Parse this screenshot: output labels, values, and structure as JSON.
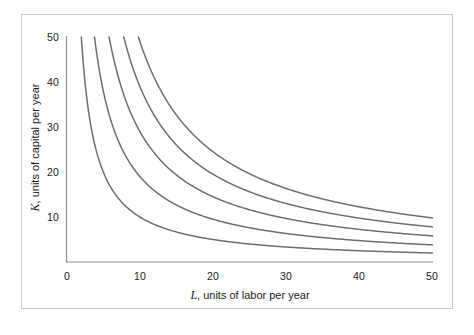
{
  "figure": {
    "background_color": "#ffffff",
    "frame_color": "#c9c9c9",
    "curve_color": "#6e6e6e"
  },
  "axes": {
    "x": {
      "var_symbol": "L",
      "label_rest": ", units of labor per year",
      "full_label": "L, units of labor per year",
      "ticks": [
        "0",
        "10",
        "20",
        "30",
        "40",
        "50"
      ],
      "tick_values": [
        0,
        10,
        20,
        30,
        40,
        50
      ],
      "min": 0,
      "max": 50
    },
    "y": {
      "var_symbol": "K",
      "label_rest": ", units of capital per year",
      "full_label": "K, units of capital per year",
      "ticks": [
        "10",
        "20",
        "30",
        "40",
        "50"
      ],
      "tick_values": [
        10,
        20,
        30,
        40,
        50
      ],
      "min": 0,
      "max": 50
    }
  },
  "chart_data": {
    "type": "line",
    "title": "",
    "subtitle": "",
    "xlabel": "L, units of labor per year",
    "ylabel": "K, units of capital per year",
    "xlim": [
      0,
      50
    ],
    "ylim": [
      0,
      50
    ],
    "xticks": [
      0,
      10,
      20,
      30,
      40,
      50
    ],
    "yticks": [
      0,
      10,
      20,
      30,
      40,
      50
    ],
    "grid": false,
    "legend": "none",
    "annotations": [],
    "curve_family": "isoquants, K = C / L (rectangular hyperbolas)",
    "series": [
      {
        "name": "isoquant-1",
        "constant": 100,
        "x": [
          2.0,
          3,
          4,
          5,
          6,
          7,
          8,
          9,
          10,
          12,
          14,
          16,
          18,
          20,
          25,
          30,
          35,
          40,
          45,
          50
        ],
        "values": [
          50.0,
          33.3,
          25.0,
          20.0,
          16.7,
          14.3,
          12.5,
          11.1,
          10.0,
          8.3,
          7.1,
          6.3,
          5.6,
          5.0,
          4.0,
          3.3,
          2.9,
          2.5,
          2.2,
          2.0
        ]
      },
      {
        "name": "isoquant-2",
        "constant": 190,
        "x": [
          3.8,
          5,
          6,
          7,
          8,
          9,
          10,
          12,
          14,
          16,
          18,
          20,
          25,
          30,
          35,
          40,
          45,
          50
        ],
        "values": [
          50.0,
          38.0,
          31.7,
          27.1,
          23.8,
          21.1,
          19.0,
          15.8,
          13.6,
          11.9,
          10.6,
          9.5,
          7.6,
          6.3,
          5.4,
          4.8,
          4.2,
          3.8
        ]
      },
      {
        "name": "isoquant-3",
        "constant": 290,
        "x": [
          5.8,
          7,
          8,
          9,
          10,
          12,
          14,
          16,
          18,
          20,
          25,
          30,
          35,
          40,
          45,
          50
        ],
        "values": [
          50.0,
          41.4,
          36.3,
          32.2,
          29.0,
          24.2,
          20.7,
          18.1,
          16.1,
          14.5,
          11.6,
          9.7,
          8.3,
          7.3,
          6.4,
          5.8
        ]
      },
      {
        "name": "isoquant-4",
        "constant": 390,
        "x": [
          7.8,
          9,
          10,
          12,
          14,
          16,
          18,
          20,
          25,
          30,
          35,
          40,
          45,
          50
        ],
        "values": [
          50.0,
          43.3,
          39.0,
          32.5,
          27.9,
          24.4,
          21.7,
          19.5,
          15.6,
          13.0,
          11.1,
          9.8,
          8.7,
          7.8
        ]
      },
      {
        "name": "isoquant-5",
        "constant": 490,
        "x": [
          9.8,
          11,
          12,
          14,
          16,
          18,
          20,
          25,
          30,
          35,
          40,
          45,
          50
        ],
        "values": [
          50.0,
          44.5,
          40.8,
          35.0,
          30.6,
          27.2,
          24.5,
          19.6,
          16.3,
          14.0,
          12.3,
          10.9,
          9.8
        ]
      }
    ]
  }
}
